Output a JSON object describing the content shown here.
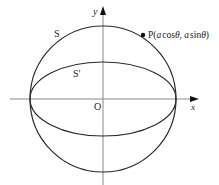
{
  "diagram": {
    "axes": {
      "x_label": "x",
      "y_label": "y",
      "origin_label": "O"
    },
    "curves": {
      "circle_label": "S",
      "ellipse_label": "S'"
    },
    "point": {
      "name": "P",
      "open": "(",
      "x_coef": "a",
      "x_fn": "cos",
      "theta": "θ",
      "sep": ", ",
      "y_coef": "a",
      "y_fn": "sin",
      "close": ")"
    },
    "colors": {
      "curve": "#2a2a2a",
      "axis": "#8a8a8a",
      "arrow": "#111111"
    }
  }
}
